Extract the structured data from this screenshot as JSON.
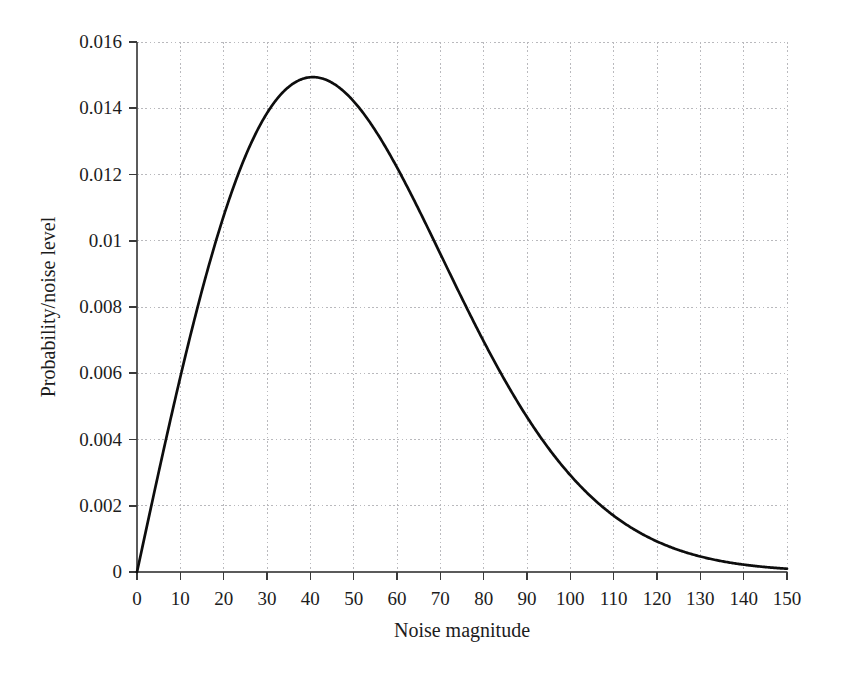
{
  "chart_data": {
    "type": "line",
    "title": "",
    "subtitle": "",
    "xlabel": "Noise magnitude",
    "ylabel": "Probability/noise level",
    "xlim": [
      0,
      150
    ],
    "ylim": [
      0,
      0.016
    ],
    "grid": true,
    "legend": null,
    "legend_position": "none",
    "xticks": [
      0,
      10,
      20,
      30,
      40,
      50,
      60,
      70,
      80,
      90,
      100,
      110,
      120,
      130,
      140,
      150
    ],
    "xtick_labels": [
      "0",
      "10",
      "20",
      "30",
      "40",
      "50",
      "60",
      "70",
      "80",
      "90",
      "100",
      "110",
      "120",
      "130",
      "140",
      "150"
    ],
    "yticks": [
      0,
      0.002,
      0.004,
      0.006,
      0.008,
      0.01,
      0.012,
      0.014,
      0.016
    ],
    "ytick_labels": [
      "0",
      "0.002",
      "0.004",
      "0.006",
      "0.008",
      "0.01",
      "0.012",
      "0.014",
      "0.016"
    ],
    "series": [
      {
        "name": "Rayleigh noise probability density",
        "color": "#0d0d0d",
        "line_width": 2.7,
        "x": [
          0,
          2,
          4,
          6,
          8,
          10,
          12,
          14,
          16,
          18,
          20,
          22,
          24,
          26,
          28,
          30,
          32,
          34,
          36,
          38,
          40,
          42,
          44,
          46,
          48,
          50,
          52,
          54,
          56,
          58,
          60,
          64,
          68,
          72,
          76,
          80,
          84,
          88,
          92,
          96,
          100,
          105,
          110,
          115,
          120,
          125,
          130,
          135,
          140,
          145,
          150
        ],
        "y": [
          0.0,
          0.00121,
          0.00241,
          0.00358,
          0.00472,
          0.00582,
          0.00687,
          0.00786,
          0.00878,
          0.00964,
          0.01042,
          0.01112,
          0.01175,
          0.01229,
          0.01275,
          0.01313,
          0.01344,
          0.01366,
          0.01382,
          0.01391,
          0.01394,
          0.01391,
          0.01382,
          0.01368,
          0.0135,
          0.01327,
          0.01301,
          0.01271,
          0.01238,
          0.01202,
          0.01164,
          0.01082,
          0.00995,
          0.00905,
          0.00814,
          0.00724,
          0.00637,
          0.00553,
          0.00475,
          0.00403,
          0.00338,
          0.00267,
          0.00207,
          0.00158,
          0.00118,
          0.00087,
          0.00063,
          0.00045,
          0.00031,
          0.00021,
          0.00014
        ],
        "peak": {
          "x": 41,
          "y": 0.0147
        },
        "distribution": "rayleigh",
        "sigma": 40.6
      }
    ],
    "axes_geometry": {
      "plot_left_px": 137,
      "plot_right_px": 787,
      "plot_top_px": 42,
      "plot_bottom_px": 572
    }
  }
}
